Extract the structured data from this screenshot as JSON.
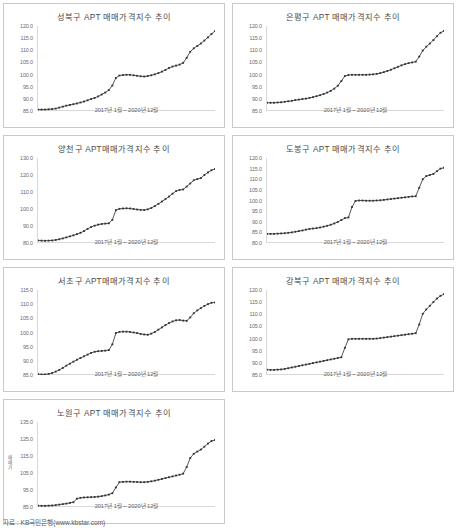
{
  "footer": {
    "source_label": "자료 : KB국민은행(www.kbstar.com)"
  },
  "common": {
    "x_caption": "2017년 1월 ~ 2020년 12월",
    "line_color": "#444444",
    "marker_color": "#333333",
    "border_color": "#c9c9c9",
    "axis_color": "#d8d8d8"
  },
  "chart_data": [
    {
      "type": "line",
      "title": "성북구 APT 매매가격지수 추이",
      "xlabel": "2017년 1월 ~ 2020년 12월",
      "ylabel": "",
      "ylim": [
        85.0,
        120.0
      ],
      "yticks": [
        "120.0",
        "115.0",
        "110.0",
        "105.0",
        "100.0",
        "95.0",
        "90.0",
        "85.0"
      ],
      "grid": false,
      "legend": "none",
      "x": [
        "2017-01",
        "2017-02",
        "2017-03",
        "2017-04",
        "2017-05",
        "2017-06",
        "2017-07",
        "2017-08",
        "2017-09",
        "2017-10",
        "2017-11",
        "2017-12",
        "2018-01",
        "2018-02",
        "2018-03",
        "2018-04",
        "2018-05",
        "2018-06",
        "2018-07",
        "2018-08",
        "2018-09",
        "2018-10",
        "2018-11",
        "2018-12",
        "2019-01",
        "2019-02",
        "2019-03",
        "2019-04",
        "2019-05",
        "2019-06",
        "2019-07",
        "2019-08",
        "2019-09",
        "2019-10",
        "2019-11",
        "2019-12",
        "2020-01",
        "2020-02",
        "2020-03",
        "2020-04",
        "2020-05",
        "2020-06",
        "2020-07",
        "2020-08",
        "2020-09",
        "2020-10",
        "2020-11",
        "2020-12"
      ],
      "values": [
        85.6,
        85.6,
        85.6,
        85.7,
        85.8,
        86.0,
        86.4,
        86.8,
        87.2,
        87.5,
        87.8,
        88.1,
        88.5,
        88.9,
        89.4,
        89.9,
        90.4,
        91.0,
        91.8,
        92.6,
        93.6,
        95.5,
        98.6,
        99.6,
        99.8,
        99.9,
        99.9,
        99.7,
        99.5,
        99.3,
        99.2,
        99.4,
        99.7,
        100.1,
        100.6,
        101.2,
        101.9,
        102.7,
        103.3,
        103.7,
        104.1,
        104.8,
        106.9,
        109.4,
        110.8,
        111.8,
        112.8,
        114.0,
        115.3,
        116.7,
        117.9
      ]
    },
    {
      "type": "line",
      "title": "은평구 APT 매매가격지수 추이",
      "xlabel": "2017년 1월 ~ 2020년 12월",
      "ylabel": "",
      "ylim": [
        85.0,
        120.0
      ],
      "yticks": [
        "120.0",
        "115.0",
        "110.0",
        "105.0",
        "100.0",
        "95.0",
        "90.0",
        "85.0"
      ],
      "grid": false,
      "legend": "none",
      "x": [
        "2017-01",
        "2017-02",
        "2017-03",
        "2017-04",
        "2017-05",
        "2017-06",
        "2017-07",
        "2017-08",
        "2017-09",
        "2017-10",
        "2017-11",
        "2017-12",
        "2018-01",
        "2018-02",
        "2018-03",
        "2018-04",
        "2018-05",
        "2018-06",
        "2018-07",
        "2018-08",
        "2018-09",
        "2018-10",
        "2018-11",
        "2018-12",
        "2019-01",
        "2019-02",
        "2019-03",
        "2019-04",
        "2019-05",
        "2019-06",
        "2019-07",
        "2019-08",
        "2019-09",
        "2019-10",
        "2019-11",
        "2019-12",
        "2020-01",
        "2020-02",
        "2020-03",
        "2020-04",
        "2020-05",
        "2020-06",
        "2020-07",
        "2020-08",
        "2020-09",
        "2020-10",
        "2020-11",
        "2020-12"
      ],
      "values": [
        88.4,
        88.4,
        88.4,
        88.5,
        88.6,
        88.8,
        89.0,
        89.2,
        89.5,
        89.7,
        89.9,
        90.1,
        90.4,
        90.7,
        91.1,
        91.5,
        92.0,
        92.6,
        93.3,
        94.2,
        95.4,
        97.3,
        99.4,
        99.8,
        99.9,
        99.9,
        99.9,
        99.9,
        99.9,
        100.0,
        100.1,
        100.3,
        100.6,
        101.0,
        101.5,
        102.0,
        102.6,
        103.2,
        103.8,
        104.3,
        104.7,
        105.0,
        105.3,
        107.4,
        109.9,
        111.5,
        112.8,
        114.2,
        115.8,
        117.2,
        118.0
      ]
    },
    {
      "type": "line",
      "title": "양천구 APT매매가격지수 추이",
      "xlabel": "2017년 1월 ~ 2020년 12월",
      "ylabel": "",
      "ylim": [
        80.0,
        130.0
      ],
      "yticks": [
        "130.0",
        "120.0",
        "110.0",
        "100.0",
        "90.0",
        "80.0"
      ],
      "grid": false,
      "legend": "none",
      "x": [
        "2017-01",
        "2017-02",
        "2017-03",
        "2017-04",
        "2017-05",
        "2017-06",
        "2017-07",
        "2017-08",
        "2017-09",
        "2017-10",
        "2017-11",
        "2017-12",
        "2018-01",
        "2018-02",
        "2018-03",
        "2018-04",
        "2018-05",
        "2018-06",
        "2018-07",
        "2018-08",
        "2018-09",
        "2018-10",
        "2018-11",
        "2018-12",
        "2019-01",
        "2019-02",
        "2019-03",
        "2019-04",
        "2019-05",
        "2019-06",
        "2019-07",
        "2019-08",
        "2019-09",
        "2019-10",
        "2019-11",
        "2019-12",
        "2020-01",
        "2020-02",
        "2020-03",
        "2020-04",
        "2020-05",
        "2020-06",
        "2020-07",
        "2020-08",
        "2020-09",
        "2020-10",
        "2020-11",
        "2020-12"
      ],
      "values": [
        81.5,
        81.4,
        81.3,
        81.4,
        81.5,
        81.8,
        82.2,
        82.7,
        83.3,
        83.9,
        84.5,
        85.2,
        86.0,
        87.0,
        88.3,
        89.4,
        90.2,
        90.8,
        91.2,
        91.4,
        91.6,
        93.6,
        99.3,
        100.1,
        100.3,
        100.4,
        100.3,
        100.0,
        99.7,
        99.5,
        99.4,
        99.8,
        100.6,
        101.7,
        103.0,
        104.4,
        105.8,
        107.3,
        109.0,
        110.5,
        111.2,
        111.5,
        113.2,
        115.0,
        116.9,
        117.6,
        118.2,
        120.0,
        121.5,
        122.8,
        123.5
      ]
    },
    {
      "type": "line",
      "title": "도봉구 APT 매매가격지수 추이",
      "xlabel": "2017년 1월 ~ 2020년 12월",
      "ylabel": "",
      "ylim": [
        80.0,
        120.0
      ],
      "yticks": [
        "120.0",
        "115.0",
        "110.0",
        "105.0",
        "100.0",
        "95.0",
        "90.0",
        "85.0",
        "80.0"
      ],
      "grid": false,
      "legend": "none",
      "x": [
        "2017-01",
        "2017-02",
        "2017-03",
        "2017-04",
        "2017-05",
        "2017-06",
        "2017-07",
        "2017-08",
        "2017-09",
        "2017-10",
        "2017-11",
        "2017-12",
        "2018-01",
        "2018-02",
        "2018-03",
        "2018-04",
        "2018-05",
        "2018-06",
        "2018-07",
        "2018-08",
        "2018-09",
        "2018-10",
        "2018-11",
        "2018-12",
        "2019-01",
        "2019-02",
        "2019-03",
        "2019-04",
        "2019-05",
        "2019-06",
        "2019-07",
        "2019-08",
        "2019-09",
        "2019-10",
        "2019-11",
        "2019-12",
        "2020-01",
        "2020-02",
        "2020-03",
        "2020-04",
        "2020-05",
        "2020-06",
        "2020-07",
        "2020-08",
        "2020-09",
        "2020-10",
        "2020-11",
        "2020-12"
      ],
      "values": [
        84.3,
        84.3,
        84.3,
        84.4,
        84.5,
        84.6,
        84.8,
        85.0,
        85.3,
        85.6,
        85.9,
        86.3,
        86.6,
        86.8,
        87.0,
        87.3,
        87.7,
        88.1,
        88.6,
        89.2,
        89.9,
        90.8,
        91.7,
        92.0,
        96.9,
        99.8,
        100.0,
        100.0,
        99.9,
        99.9,
        99.9,
        100.0,
        100.1,
        100.3,
        100.5,
        100.7,
        100.9,
        101.1,
        101.3,
        101.5,
        101.7,
        101.9,
        102.0,
        106.0,
        110.0,
        111.5,
        112.0,
        112.5,
        113.8,
        115.0,
        115.4
      ]
    },
    {
      "type": "line",
      "title": "서초구 APT매매가격지수 추이",
      "xlabel": "2017년 1월 ~ 2020년 12월",
      "ylabel": "",
      "ylim": [
        85.0,
        115.0
      ],
      "yticks": [
        "115.0",
        "110.0",
        "105.0",
        "100.0",
        "95.0",
        "90.0",
        "85.0"
      ],
      "grid": false,
      "legend": "none",
      "x": [
        "2017-01",
        "2017-02",
        "2017-03",
        "2017-04",
        "2017-05",
        "2017-06",
        "2017-07",
        "2017-08",
        "2017-09",
        "2017-10",
        "2017-11",
        "2017-12",
        "2018-01",
        "2018-02",
        "2018-03",
        "2018-04",
        "2018-05",
        "2018-06",
        "2018-07",
        "2018-08",
        "2018-09",
        "2018-10",
        "2018-11",
        "2018-12",
        "2019-01",
        "2019-02",
        "2019-03",
        "2019-04",
        "2019-05",
        "2019-06",
        "2019-07",
        "2019-08",
        "2019-09",
        "2019-10",
        "2019-11",
        "2019-12",
        "2020-01",
        "2020-02",
        "2020-03",
        "2020-04",
        "2020-05",
        "2020-06",
        "2020-07",
        "2020-08",
        "2020-09",
        "2020-10",
        "2020-11",
        "2020-12"
      ],
      "values": [
        85.3,
        85.2,
        85.2,
        85.4,
        85.7,
        86.2,
        86.8,
        87.5,
        88.3,
        89.0,
        89.7,
        90.4,
        91.0,
        91.6,
        92.2,
        92.8,
        93.2,
        93.4,
        93.5,
        93.6,
        93.8,
        95.8,
        99.8,
        100.2,
        100.3,
        100.3,
        100.2,
        100.0,
        99.8,
        99.5,
        99.3,
        99.2,
        99.6,
        100.2,
        101.0,
        101.8,
        102.6,
        103.3,
        103.9,
        104.3,
        104.4,
        104.2,
        104.1,
        105.3,
        106.8,
        107.8,
        108.6,
        109.4,
        110.0,
        110.5,
        110.6
      ]
    },
    {
      "type": "line",
      "title": "강북구 APT 매매가격지수 추이",
      "xlabel": "2017년 1월 ~ 2020년 12월",
      "ylabel": "",
      "ylim": [
        85.0,
        120.0
      ],
      "yticks": [
        "120.0",
        "115.0",
        "110.0",
        "105.0",
        "100.0",
        "95.0",
        "90.0",
        "85.0"
      ],
      "grid": false,
      "legend": "none",
      "x": [
        "2017-01",
        "2017-02",
        "2017-03",
        "2017-04",
        "2017-05",
        "2017-06",
        "2017-07",
        "2017-08",
        "2017-09",
        "2017-10",
        "2017-11",
        "2017-12",
        "2018-01",
        "2018-02",
        "2018-03",
        "2018-04",
        "2018-05",
        "2018-06",
        "2018-07",
        "2018-08",
        "2018-09",
        "2018-10",
        "2018-11",
        "2018-12",
        "2019-01",
        "2019-02",
        "2019-03",
        "2019-04",
        "2019-05",
        "2019-06",
        "2019-07",
        "2019-08",
        "2019-09",
        "2019-10",
        "2019-11",
        "2019-12",
        "2020-01",
        "2020-02",
        "2020-03",
        "2020-04",
        "2020-05",
        "2020-06",
        "2020-07",
        "2020-08",
        "2020-09",
        "2020-10",
        "2020-11",
        "2020-12"
      ],
      "values": [
        87.2,
        87.1,
        87.1,
        87.2,
        87.3,
        87.5,
        87.8,
        88.1,
        88.4,
        88.7,
        89.0,
        89.3,
        89.6,
        89.9,
        90.2,
        90.5,
        90.8,
        91.1,
        91.4,
        91.7,
        92.0,
        92.3,
        96.2,
        99.7,
        99.9,
        99.9,
        99.9,
        99.9,
        99.9,
        99.9,
        99.9,
        100.0,
        100.2,
        100.4,
        100.6,
        100.8,
        101.0,
        101.2,
        101.4,
        101.6,
        101.8,
        102.0,
        102.2,
        105.8,
        110.2,
        112.0,
        113.5,
        115.0,
        116.5,
        117.6,
        118.3
      ]
    },
    {
      "type": "line",
      "title": "노원구 APT 매매가격지수 추이",
      "xlabel": "2017년 1월 ~ 2020년 12월",
      "ylabel": "매매가",
      "ylim": [
        85.0,
        135.0
      ],
      "yticks": [
        "135.0",
        "125.0",
        "115.0",
        "105.0",
        "95.0",
        "85.0"
      ],
      "grid": false,
      "legend": "none",
      "x": [
        "2017-01",
        "2017-02",
        "2017-03",
        "2017-04",
        "2017-05",
        "2017-06",
        "2017-07",
        "2017-08",
        "2017-09",
        "2017-10",
        "2017-11",
        "2017-12",
        "2018-01",
        "2018-02",
        "2018-03",
        "2018-04",
        "2018-05",
        "2018-06",
        "2018-07",
        "2018-08",
        "2018-09",
        "2018-10",
        "2018-11",
        "2018-12",
        "2019-01",
        "2019-02",
        "2019-03",
        "2019-04",
        "2019-05",
        "2019-06",
        "2019-07",
        "2019-08",
        "2019-09",
        "2019-10",
        "2019-11",
        "2019-12",
        "2020-01",
        "2020-02",
        "2020-03",
        "2020-04",
        "2020-05",
        "2020-06",
        "2020-07",
        "2020-08",
        "2020-09",
        "2020-10",
        "2020-11",
        "2020-12"
      ],
      "values": [
        85.8,
        85.7,
        85.7,
        85.8,
        85.9,
        86.1,
        86.4,
        86.7,
        87.0,
        87.4,
        87.8,
        89.9,
        90.4,
        90.6,
        90.7,
        90.8,
        90.9,
        91.1,
        91.4,
        91.8,
        92.3,
        93.1,
        96.5,
        99.6,
        99.8,
        99.9,
        99.9,
        99.8,
        99.7,
        99.6,
        99.6,
        99.8,
        100.1,
        100.5,
        101.0,
        101.5,
        102.0,
        102.5,
        103.0,
        103.5,
        104.0,
        104.6,
        108.5,
        113.8,
        116.3,
        117.6,
        118.8,
        120.5,
        122.3,
        123.8,
        124.4
      ]
    }
  ]
}
